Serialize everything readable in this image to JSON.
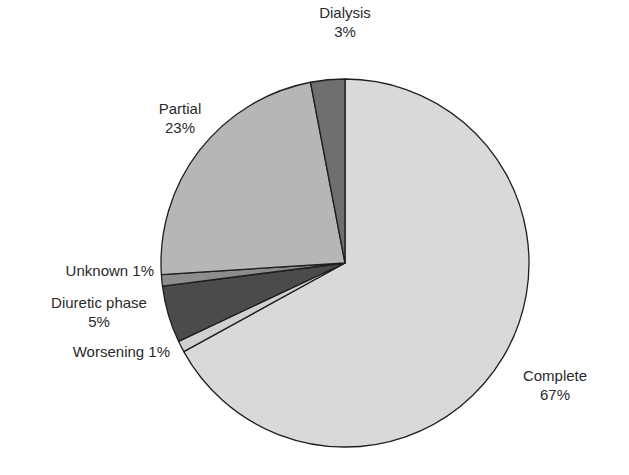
{
  "chart_data": {
    "type": "pie",
    "title": "",
    "slices": [
      {
        "label": "Complete",
        "value": 67,
        "display": "67%",
        "color": "#d9d9d9"
      },
      {
        "label": "Worsening",
        "value": 1,
        "display": "1%",
        "color": "#d0d0d0"
      },
      {
        "label": "Diuretic phase",
        "value": 5,
        "display": "5%",
        "color": "#4b4b4b"
      },
      {
        "label": "Unknown",
        "value": 1,
        "display": "1%",
        "color": "#8d8d8d"
      },
      {
        "label": "Partial",
        "value": 23,
        "display": "23%",
        "color": "#b6b6b6"
      },
      {
        "label": "Dialysis",
        "value": 3,
        "display": "3%",
        "color": "#6f6f6f"
      }
    ],
    "start_angle_deg": 0,
    "direction": "clockwise",
    "legend": "none (direct labels)"
  },
  "labels": {
    "complete": {
      "name": "Complete",
      "pct": "67%"
    },
    "worsening": {
      "text": "Worsening 1%"
    },
    "diuretic": {
      "name": "Diuretic phase",
      "pct": "5%"
    },
    "unknown": {
      "text": "Unknown 1%"
    },
    "partial": {
      "name": "Partial",
      "pct": "23%"
    },
    "dialysis": {
      "name": "Dialysis",
      "pct": "3%"
    }
  }
}
